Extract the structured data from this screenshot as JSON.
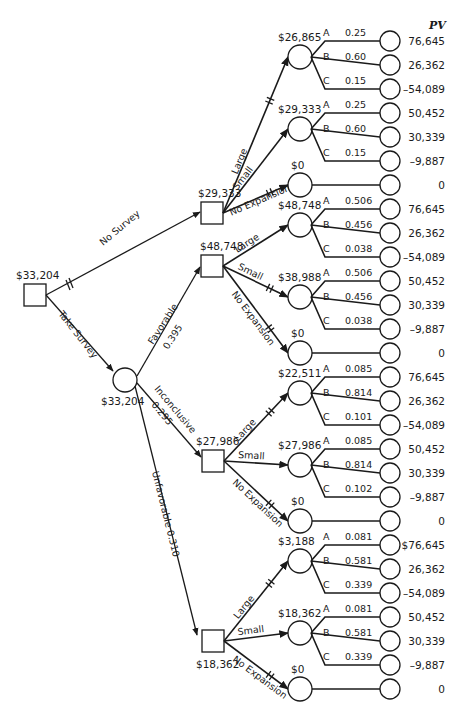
{
  "root": {
    "value": "$33,204"
  },
  "pv_header": "PV",
  "no_survey": {
    "label": "No Survey",
    "decision_value": "$29,333",
    "branches": [
      {
        "label": "Large",
        "ev": "$26,865",
        "outcomes": [
          {
            "letter": "A",
            "prob": "0.25",
            "pv": "76,645"
          },
          {
            "letter": "B",
            "prob": "0.60",
            "pv": "26,362"
          },
          {
            "letter": "C",
            "prob": "0.15",
            "pv": "–54,089"
          }
        ]
      },
      {
        "label": "Small",
        "ev": "$29,333",
        "outcomes": [
          {
            "letter": "A",
            "prob": "0.25",
            "pv": "50,452"
          },
          {
            "letter": "B",
            "prob": "0.60",
            "pv": "30,339"
          },
          {
            "letter": "C",
            "prob": "0.15",
            "pv": "–9,887"
          }
        ]
      },
      {
        "label": "No Expansion",
        "ev": "$0",
        "outcomes": [
          {
            "pv": "0"
          }
        ]
      }
    ]
  },
  "take_survey": {
    "label": "Take Survey",
    "chance_value": "$33,204",
    "results": [
      {
        "label": "Favorable",
        "prob": "0.395",
        "decision_value": "$48,748",
        "branches": [
          {
            "label": "Large",
            "ev": "$48,748",
            "outcomes": [
              {
                "letter": "A",
                "prob": "0.506",
                "pv": "76,645"
              },
              {
                "letter": "B",
                "prob": "0.456",
                "pv": "26,362"
              },
              {
                "letter": "C",
                "prob": "0.038",
                "pv": "–54,089"
              }
            ]
          },
          {
            "label": "Small",
            "ev": "$38,988",
            "outcomes": [
              {
                "letter": "A",
                "prob": "0.506",
                "pv": "50,452"
              },
              {
                "letter": "B",
                "prob": "0.456",
                "pv": "30,339"
              },
              {
                "letter": "C",
                "prob": "0.038",
                "pv": "–9,887"
              }
            ]
          },
          {
            "label": "No Expansion",
            "ev": "$0",
            "outcomes": [
              {
                "pv": "0"
              }
            ]
          }
        ]
      },
      {
        "label": "Inconclusive",
        "prob": "0.295",
        "decision_value": "$27,986",
        "branches": [
          {
            "label": "Large",
            "ev": "$22,511",
            "outcomes": [
              {
                "letter": "A",
                "prob": "0.085",
                "pv": "76,645"
              },
              {
                "letter": "B",
                "prob": "0.814",
                "pv": "26,362"
              },
              {
                "letter": "C",
                "prob": "0.101",
                "pv": "–54,089"
              }
            ]
          },
          {
            "label": "Small",
            "ev": "$27,986",
            "outcomes": [
              {
                "letter": "A",
                "prob": "0.085",
                "pv": "50,452"
              },
              {
                "letter": "B",
                "prob": "0.814",
                "pv": "30,339"
              },
              {
                "letter": "C",
                "prob": "0.102",
                "pv": "–9,887"
              }
            ]
          },
          {
            "label": "No Expansion",
            "ev": "$0",
            "outcomes": [
              {
                "pv": "0"
              }
            ]
          }
        ]
      },
      {
        "label": "Unfavorable",
        "prob": "0.310",
        "decision_value": "$18,362",
        "branches": [
          {
            "label": "Large",
            "ev": "$3,188",
            "outcomes": [
              {
                "letter": "A",
                "prob": "0.081",
                "pv": "$76,645"
              },
              {
                "letter": "B",
                "prob": "0.581",
                "pv": "26,362"
              },
              {
                "letter": "C",
                "prob": "0.339",
                "pv": "–54,089"
              }
            ]
          },
          {
            "label": "Small",
            "ev": "$18,362",
            "outcomes": [
              {
                "letter": "A",
                "prob": "0.081",
                "pv": "50,452"
              },
              {
                "letter": "B",
                "prob": "0.581",
                "pv": "30,339"
              },
              {
                "letter": "C",
                "prob": "0.339",
                "pv": "–9,887"
              }
            ]
          },
          {
            "label": "No Expansion",
            "ev": "$0",
            "outcomes": [
              {
                "pv": "0"
              }
            ]
          }
        ]
      }
    ]
  }
}
